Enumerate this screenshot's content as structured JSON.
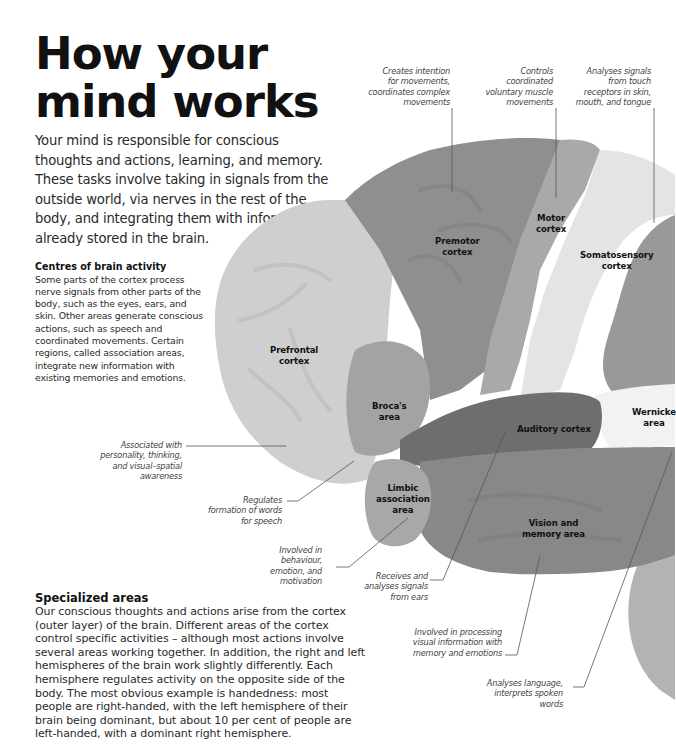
{
  "title": {
    "line1": "How your",
    "line2": "mind works"
  },
  "intro": "Your mind is responsible for conscious thoughts and actions, learning, and memory. These tasks involve taking in signals from the outside world, via nerves in the rest of the body, and integrating them with information already stored in the brain.",
  "sections": {
    "centres": {
      "heading": "Centres of brain activity",
      "body": "Some parts of the cortex process nerve signals from other parts of the body, such as the eyes, ears, and skin. Other areas generate conscious actions, such as speech and coordinated movements. Certain regions, called association areas, integrate new information with existing memories and emotions."
    },
    "specialized": {
      "heading": "Specialized areas",
      "body": "Our conscious thoughts and actions arise from the cortex (outer layer) of the brain. Different areas of the cortex control specific activities – although most actions involve several areas working together. In addition, the right and left hemispheres of the brain work slightly differently. Each hemisphere regulates activity on the opposite side of the body. The most obvious example is handedness: most people are right-handed, with the left hemisphere of their brain being dominant, but about 10 per cent of people are left-handed, with a dominant right hemisphere."
    }
  },
  "regions": [
    {
      "id": "prefrontal",
      "line1": "Prefrontal",
      "line2": "cortex"
    },
    {
      "id": "premotor",
      "line1": "Premotor",
      "line2": "cortex"
    },
    {
      "id": "motor",
      "line1": "Motor",
      "line2": "cortex"
    },
    {
      "id": "somatosensory",
      "line1": "Somatosensory",
      "line2": "cortex"
    },
    {
      "id": "broca",
      "line1": "Broca's",
      "line2": "area"
    },
    {
      "id": "auditory",
      "line1": "Auditory cortex",
      "line2": ""
    },
    {
      "id": "wernicke",
      "line1": "Wernicke",
      "line2": "area"
    },
    {
      "id": "limbic",
      "line1": "Limbic",
      "line2": "association",
      "line3": "area"
    },
    {
      "id": "vision",
      "line1": "Vision and",
      "line2": "memory area"
    }
  ],
  "annotations": {
    "premotor": [
      "Creates intention",
      "for movements,",
      "coordinates complex",
      "movements"
    ],
    "motor": [
      "Controls",
      "coordinated",
      "voluntary muscle",
      "movements"
    ],
    "somatosensory": [
      "Analyses signals",
      "from touch",
      "receptors in skin,",
      "mouth, and tongue"
    ],
    "prefrontal": [
      "Associated with",
      "personality, thinking,",
      "and visual–spatial",
      "awareness"
    ],
    "broca": [
      "Regulates",
      "formation of words",
      "for speech"
    ],
    "limbic": [
      "Involved in",
      "behaviour,",
      "emotion, and",
      "motivation"
    ],
    "auditory": [
      "Receives and",
      "analyses signals",
      "from ears"
    ],
    "vision": [
      "Involved in processing",
      "visual information with",
      "memory and emotions"
    ],
    "wernicke": [
      "Analyses language,",
      "interprets spoken",
      "words"
    ]
  },
  "colors": {
    "prefrontal": "#cfcfcf",
    "premotor": "#8f8f8f",
    "motor": "#a9a9a9",
    "somatosensory": "#e4e4e4",
    "broca": "#a3a3a3",
    "auditory": "#6e6e6e",
    "wernicke": "#f2f2f2",
    "limbic": "#a8a8a8",
    "vision": "#888888",
    "parietal": "#999999",
    "cerebellum": "#b3b3b3",
    "leader": "#555555"
  }
}
